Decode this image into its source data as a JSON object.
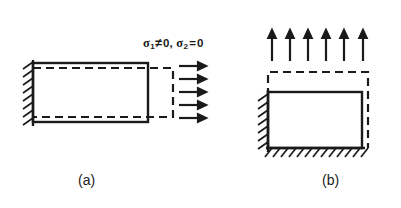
{
  "figure": {
    "width": 401,
    "height": 208,
    "background_color": "#ffffff",
    "line_color": "#1a1a1a"
  },
  "panels": [
    {
      "id": "a",
      "caption": "(a)",
      "stress_label": {
        "full_text": "σ₁ ≠ 0, σ₂ = 0",
        "terms": [
          {
            "symbol": "σ",
            "subscript": "1",
            "relation": "≠",
            "value": "0"
          },
          {
            "symbol": "σ",
            "subscript": "2",
            "relation": "=",
            "value": "0"
          }
        ]
      },
      "loading_direction": "horizontal-right",
      "arrow_count": 5,
      "support": "left-wall-hatched",
      "undeformed_shape": "solid-rectangle",
      "deformed_shape": "dashed-outline-extended-right-and-necked"
    },
    {
      "id": "b",
      "caption": "(b)",
      "stress_label": {
        "full_text": "σ₂ ≠ 0, σ₁ = 0",
        "terms": [
          {
            "symbol": "σ",
            "subscript": "2",
            "relation": "≠",
            "value": "0"
          },
          {
            "symbol": "σ",
            "subscript": "1",
            "relation": "=",
            "value": "0"
          }
        ]
      },
      "loading_direction": "vertical-up",
      "arrow_count": 6,
      "support": "left-wall-and-bottom-hatched",
      "undeformed_shape": "solid-rectangle",
      "deformed_shape": "dashed-outline-extended-up"
    }
  ]
}
